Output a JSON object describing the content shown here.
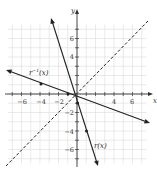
{
  "chart_data": {
    "type": "line",
    "title": "",
    "xlabel": "x",
    "ylabel": "y",
    "xlim": [
      -7.5,
      7.5
    ],
    "ylim": [
      -7.5,
      7.5
    ],
    "grid": true,
    "x_ticks": [
      -6,
      -4,
      -2,
      4,
      6
    ],
    "y_ticks": [
      6,
      4,
      -2,
      -4,
      -6
    ],
    "series": [
      {
        "name": "r(x)",
        "label": "r(x)",
        "style": "solid",
        "slope": -3,
        "intercept": -1,
        "marked_points": [
          [
            0,
            -1
          ],
          [
            1,
            -4
          ]
        ]
      },
      {
        "name": "r^-1(x)",
        "label": "r⁻¹(x)",
        "style": "solid",
        "slope": -0.3333,
        "intercept": -0.3333,
        "marked_points": [
          [
            -1,
            0
          ],
          [
            -4,
            1
          ]
        ]
      },
      {
        "name": "y = x",
        "label": "",
        "style": "dashed",
        "slope": 1,
        "intercept": 0,
        "marked_points": []
      }
    ],
    "annotations": [
      "r⁻¹(x)",
      "r(x)"
    ]
  },
  "labels": {
    "x_axis": "x",
    "y_axis": "y",
    "r": "r(x)",
    "r_inv_base": "r",
    "r_inv_sup": "−1",
    "r_inv_arg": "(x)"
  },
  "ticks": {
    "x": [
      "−6",
      "−4",
      "−2",
      "4",
      "6"
    ],
    "y": [
      "6",
      "4",
      "−2",
      "−4",
      "−6"
    ]
  },
  "colors": {
    "grid": "#d9d9d9",
    "axis": "#333333",
    "line": "#222222"
  }
}
